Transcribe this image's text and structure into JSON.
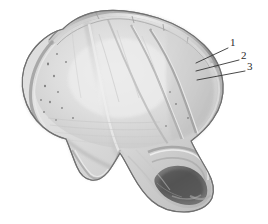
{
  "figure": {
    "type": "anatomical-line-illustration",
    "background_color": "#ffffff",
    "rendering": "grayscale shaded drawing",
    "bone_colors": {
      "outline": "#6e6e6e",
      "rim_shadow": "#9a9a9a",
      "surface_light": "#e6e6e6",
      "surface_mid": "#d5d5d5",
      "surface_dark": "#b9b9b9",
      "cavity_dark": "#5d5d5d",
      "leader_line": "#3a3a3a",
      "label_text": "#2a2a2a"
    }
  },
  "callouts": [
    {
      "id": "1",
      "label": "1",
      "label_x": 230,
      "label_y": 37,
      "leader_from_x": 228,
      "leader_from_y": 48,
      "leader_to_x": 196,
      "leader_to_y": 63
    },
    {
      "id": "2",
      "label": "2",
      "label_x": 241,
      "label_y": 50,
      "leader_from_x": 239,
      "leader_from_y": 60,
      "leader_to_x": 196,
      "leader_to_y": 71
    },
    {
      "id": "3",
      "label": "3",
      "label_x": 247,
      "label_y": 61,
      "leader_from_x": 245,
      "leader_from_y": 71,
      "leader_to_x": 197,
      "leader_to_y": 80
    }
  ]
}
